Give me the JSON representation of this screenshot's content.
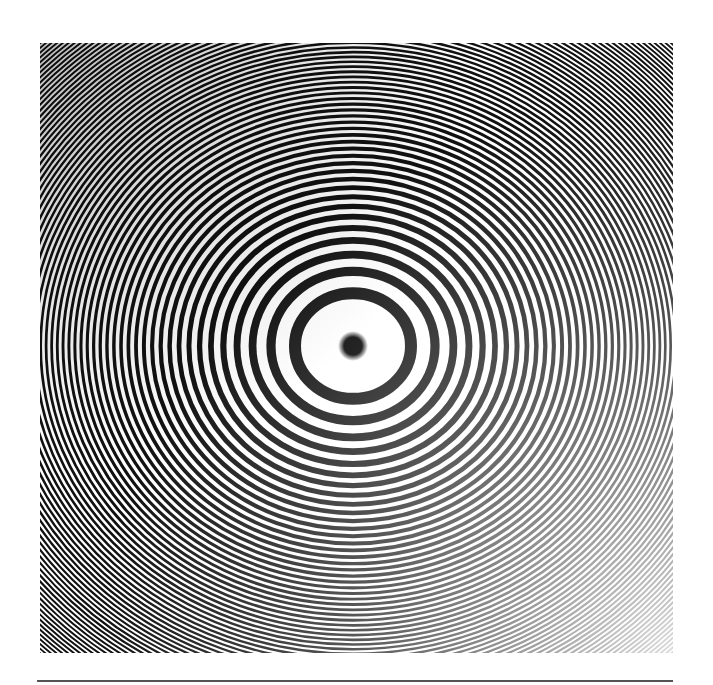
{
  "figure": {
    "photo_box": {
      "x": 40,
      "y": 43,
      "width": 633,
      "height": 610
    },
    "pattern": {
      "center": {
        "x": 313,
        "y": 303
      },
      "first_ring_radius_x": 58,
      "ellipse_ratio_y": 0.91,
      "ring_count": 140,
      "center_spot_radius": 15,
      "dark_color": "#111111",
      "light_color": "#ffffff",
      "fade_corner": "bottom-right"
    },
    "rule_line": {
      "color": "#555555",
      "thickness": 2
    }
  }
}
